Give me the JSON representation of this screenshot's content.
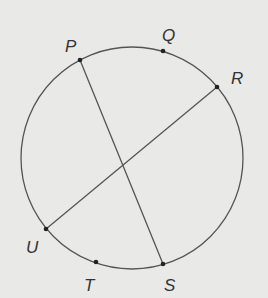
{
  "diagram": {
    "type": "circle-with-chords",
    "circle": {
      "cx": 132,
      "cy": 158,
      "r": 111
    },
    "colors": {
      "background": "#e9e9e7",
      "stroke": "#555555",
      "point": "#222222",
      "label": "#333333"
    },
    "points": [
      {
        "name": "P",
        "x": 80,
        "y": 60,
        "label_x": 65,
        "label_y": 38
      },
      {
        "name": "Q",
        "x": 163,
        "y": 51,
        "label_x": 162,
        "label_y": 27
      },
      {
        "name": "R",
        "x": 217,
        "y": 87,
        "label_x": 231,
        "label_y": 70
      },
      {
        "name": "S",
        "x": 163,
        "y": 264,
        "label_x": 164,
        "label_y": 277
      },
      {
        "name": "T",
        "x": 96,
        "y": 262,
        "label_x": 84,
        "label_y": 277
      },
      {
        "name": "U",
        "x": 46,
        "y": 229,
        "label_x": 26,
        "label_y": 239
      }
    ],
    "chords": [
      {
        "name": "PS",
        "from": "P",
        "to": "S"
      },
      {
        "name": "RU",
        "from": "R",
        "to": "U"
      }
    ]
  }
}
